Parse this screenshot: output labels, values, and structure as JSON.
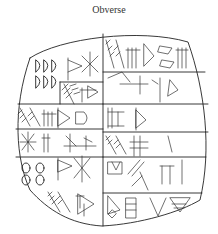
{
  "figure": {
    "title": "Obverse"
  }
}
